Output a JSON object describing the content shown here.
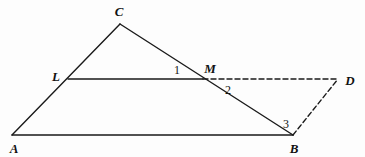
{
  "figure": {
    "background_color": "#fdfdfd",
    "stroke_color": "#1a1a1a",
    "solid_stroke_width": 1.4,
    "dashed_stroke_width": 1.4,
    "dash_pattern": "5,3",
    "canvas": {
      "width": 365,
      "height": 157
    }
  },
  "points": {
    "A": {
      "label": "A",
      "x": 12,
      "y": 135,
      "label_x": 14,
      "label_y": 148
    },
    "B": {
      "label": "B",
      "x": 293,
      "y": 135,
      "label_x": 294,
      "label_y": 148
    },
    "C": {
      "label": "C",
      "x": 120,
      "y": 24,
      "label_x": 119,
      "label_y": 11
    },
    "L": {
      "label": "L",
      "x": 68,
      "y": 79,
      "label_x": 56,
      "label_y": 76
    },
    "M": {
      "label": "M",
      "x": 203,
      "y": 79,
      "label_x": 210,
      "label_y": 68
    },
    "D": {
      "label": "D",
      "x": 338,
      "y": 79,
      "label_x": 350,
      "label_y": 80
    }
  },
  "angle_labels": [
    {
      "name": "angle-1",
      "text": "1",
      "x": 177,
      "y": 70
    },
    {
      "name": "angle-2",
      "text": "2",
      "x": 228,
      "y": 90
    },
    {
      "name": "angle-3",
      "text": "3",
      "x": 286,
      "y": 124
    }
  ],
  "segments": [
    {
      "name": "segment-AC",
      "from": "A",
      "to": "C",
      "style": "solid"
    },
    {
      "name": "segment-CB",
      "from": "C",
      "to": "B",
      "style": "solid"
    },
    {
      "name": "segment-AB",
      "from": "A",
      "to": "B",
      "style": "solid"
    },
    {
      "name": "segment-LM",
      "from": "L",
      "to": "M",
      "style": "solid"
    },
    {
      "name": "segment-MD",
      "from": "M",
      "to": "D",
      "style": "dashed"
    },
    {
      "name": "segment-BD",
      "from": "B",
      "to": "D",
      "style": "dashed"
    }
  ]
}
